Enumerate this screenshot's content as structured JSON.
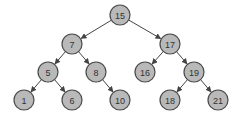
{
  "diagram": {
    "type": "binary-search-tree",
    "colors": {
      "node_fill": "#b9b9b9",
      "node_stroke": "#4a4a4a",
      "edge": "#444444",
      "text": "#333333"
    },
    "nodes": [
      {
        "id": "n15",
        "label": "15"
      },
      {
        "id": "n7",
        "label": "7"
      },
      {
        "id": "n17",
        "label": "17"
      },
      {
        "id": "n5",
        "label": "5"
      },
      {
        "id": "n8",
        "label": "8"
      },
      {
        "id": "n16",
        "label": "16"
      },
      {
        "id": "n19",
        "label": "19"
      },
      {
        "id": "n1",
        "label": "1"
      },
      {
        "id": "n6",
        "label": "6"
      },
      {
        "id": "n10",
        "label": "10"
      },
      {
        "id": "n18",
        "label": "18"
      },
      {
        "id": "n21",
        "label": "21"
      }
    ],
    "edges": [
      {
        "from": "n15",
        "to": "n7"
      },
      {
        "from": "n15",
        "to": "n17"
      },
      {
        "from": "n7",
        "to": "n5"
      },
      {
        "from": "n7",
        "to": "n8"
      },
      {
        "from": "n17",
        "to": "n16"
      },
      {
        "from": "n17",
        "to": "n19"
      },
      {
        "from": "n5",
        "to": "n1"
      },
      {
        "from": "n5",
        "to": "n6"
      },
      {
        "from": "n8",
        "to": "n10"
      },
      {
        "from": "n19",
        "to": "n18"
      },
      {
        "from": "n19",
        "to": "n21"
      }
    ]
  }
}
